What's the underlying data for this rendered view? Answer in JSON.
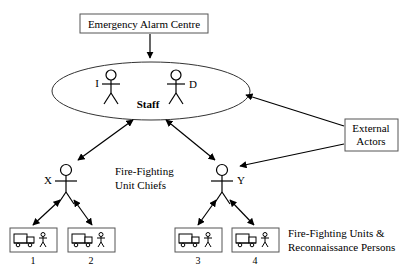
{
  "diagram": {
    "title_box": {
      "label": "Emergency Alarm Centre"
    },
    "staff_group": {
      "group_label": "Staff",
      "actors": [
        {
          "label": "I"
        },
        {
          "label": "D"
        }
      ]
    },
    "chiefs": {
      "caption_line1": "Fire-Fighting",
      "caption_line2": "Unit Chiefs",
      "items": [
        {
          "label": "X"
        },
        {
          "label": "Y"
        }
      ]
    },
    "units": {
      "caption_line1": "Fire-Fighting Units &",
      "caption_line2": "Reconnaissance Persons",
      "items": [
        {
          "number": "1",
          "icons": [
            "truck-icon",
            "person-icon"
          ]
        },
        {
          "number": "2",
          "icons": [
            "truck-icon",
            "person-icon"
          ]
        },
        {
          "number": "3",
          "icons": [
            "truck-icon",
            "person-icon"
          ]
        },
        {
          "number": "4",
          "icons": [
            "truck-icon",
            "person-icon"
          ]
        }
      ]
    },
    "external_actors_box": {
      "line1": "External",
      "line2": "Actors"
    },
    "colors": {
      "background": "#ffffff",
      "stroke": "#000000",
      "box_border": "#555555",
      "text": "#000000"
    }
  }
}
